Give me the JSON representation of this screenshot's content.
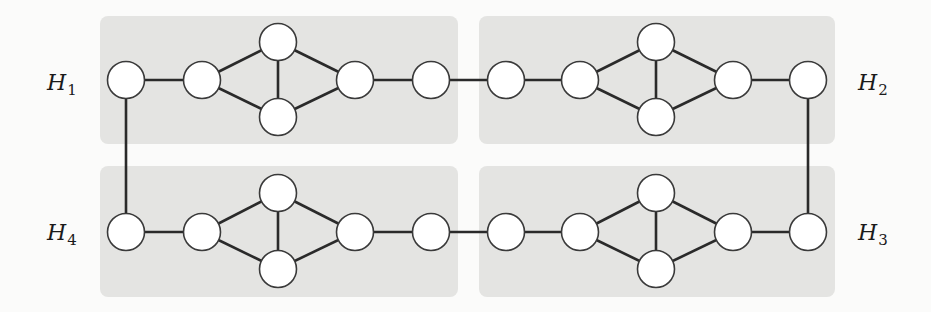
{
  "diagram": {
    "title": "",
    "colors": {
      "background": "#fbfbfa",
      "group_fill": "#e4e4e2",
      "node_fill": "#ffffff",
      "node_stroke": "#3a3a3a",
      "edge": "#2a2a2a"
    },
    "node_radius": 18.5,
    "groups": [
      {
        "id": "H1",
        "label_main": "H",
        "label_sub": "1",
        "label_pos": [
          47,
          90
        ],
        "box": [
          100,
          16,
          358,
          128
        ],
        "nodes": [
          [
            126,
            80
          ],
          [
            202,
            80
          ],
          [
            278,
            42
          ],
          [
            278,
            117
          ],
          [
            355,
            80
          ],
          [
            431,
            80
          ]
        ],
        "edges": [
          [
            0,
            1
          ],
          [
            1,
            2
          ],
          [
            1,
            3
          ],
          [
            2,
            3
          ],
          [
            2,
            4
          ],
          [
            3,
            4
          ],
          [
            4,
            5
          ]
        ]
      },
      {
        "id": "H2",
        "label_main": "H",
        "label_sub": "2",
        "label_pos": [
          858,
          90
        ],
        "box": [
          479,
          16,
          356,
          128
        ],
        "nodes": [
          [
            506,
            80
          ],
          [
            580,
            80
          ],
          [
            656,
            42
          ],
          [
            656,
            117
          ],
          [
            733,
            80
          ],
          [
            808,
            80
          ]
        ],
        "edges": [
          [
            0,
            1
          ],
          [
            1,
            2
          ],
          [
            1,
            3
          ],
          [
            2,
            3
          ],
          [
            2,
            4
          ],
          [
            3,
            4
          ],
          [
            4,
            5
          ]
        ]
      },
      {
        "id": "H3",
        "label_main": "H",
        "label_sub": "3",
        "label_pos": [
          858,
          240
        ],
        "box": [
          479,
          166,
          356,
          131
        ],
        "nodes": [
          [
            808,
            232
          ],
          [
            733,
            232
          ],
          [
            656,
            193
          ],
          [
            656,
            269
          ],
          [
            580,
            232
          ],
          [
            506,
            232
          ]
        ],
        "edges": [
          [
            0,
            1
          ],
          [
            1,
            2
          ],
          [
            1,
            3
          ],
          [
            2,
            3
          ],
          [
            2,
            4
          ],
          [
            3,
            4
          ],
          [
            4,
            5
          ]
        ]
      },
      {
        "id": "H4",
        "label_main": "H",
        "label_sub": "4",
        "label_pos": [
          47,
          240
        ],
        "box": [
          100,
          166,
          358,
          131
        ],
        "nodes": [
          [
            126,
            232
          ],
          [
            202,
            232
          ],
          [
            278,
            193
          ],
          [
            278,
            269
          ],
          [
            355,
            232
          ],
          [
            431,
            232
          ]
        ],
        "edges": [
          [
            0,
            1
          ],
          [
            1,
            2
          ],
          [
            1,
            3
          ],
          [
            2,
            3
          ],
          [
            2,
            4
          ],
          [
            3,
            4
          ],
          [
            4,
            5
          ]
        ]
      }
    ],
    "inter_group_edges": [
      {
        "from": [
          "H1",
          5
        ],
        "to": [
          "H2",
          0
        ]
      },
      {
        "from": [
          "H2",
          5
        ],
        "to": [
          "H3",
          0
        ]
      },
      {
        "from": [
          "H3",
          5
        ],
        "to": [
          "H4",
          5
        ]
      },
      {
        "from": [
          "H4",
          0
        ],
        "to": [
          "H1",
          0
        ]
      }
    ]
  }
}
